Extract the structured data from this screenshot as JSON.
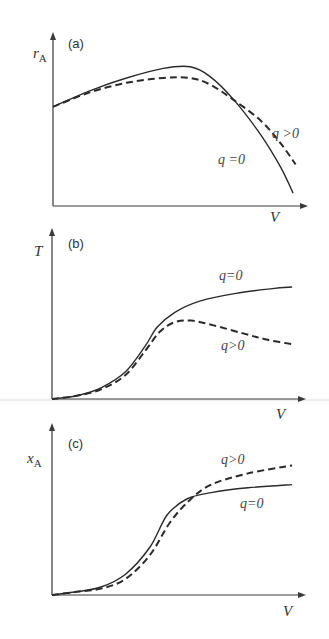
{
  "chart_data": [
    {
      "type": "line",
      "panel": "(a)",
      "ylabel": "r",
      "ylabel_sub": "A",
      "xlabel": "V",
      "grid": false,
      "legend": "inline curve labels",
      "series": [
        {
          "name": "q=0",
          "style": "solid",
          "points": [
            [
              0,
              0.62
            ],
            [
              0.15,
              0.72
            ],
            [
              0.3,
              0.8
            ],
            [
              0.45,
              0.86
            ],
            [
              0.56,
              0.87
            ],
            [
              0.64,
              0.81
            ],
            [
              0.74,
              0.66
            ],
            [
              0.85,
              0.44
            ],
            [
              0.93,
              0.24
            ],
            [
              0.98,
              0.08
            ]
          ]
        },
        {
          "name": "q>0",
          "style": "dashed",
          "points": [
            [
              0,
              0.62
            ],
            [
              0.15,
              0.71
            ],
            [
              0.3,
              0.77
            ],
            [
              0.45,
              0.8
            ],
            [
              0.56,
              0.8
            ],
            [
              0.64,
              0.76
            ],
            [
              0.74,
              0.66
            ],
            [
              0.85,
              0.53
            ],
            [
              0.93,
              0.39
            ],
            [
              0.99,
              0.26
            ]
          ]
        }
      ],
      "annotations": [
        {
          "text": "q=0",
          "x": 0.68,
          "y": 0.3
        },
        {
          "text": "q>0",
          "x": 0.88,
          "y": 0.46
        }
      ]
    },
    {
      "type": "line",
      "panel": "(b)",
      "ylabel": "T",
      "ylabel_sub": "",
      "xlabel": "V",
      "grid": false,
      "legend": "inline curve labels",
      "series": [
        {
          "name": "q=0",
          "style": "solid",
          "points": [
            [
              0,
              0
            ],
            [
              0.1,
              0.02
            ],
            [
              0.2,
              0.07
            ],
            [
              0.3,
              0.17
            ],
            [
              0.38,
              0.33
            ],
            [
              0.43,
              0.45
            ],
            [
              0.5,
              0.54
            ],
            [
              0.6,
              0.61
            ],
            [
              0.75,
              0.66
            ],
            [
              0.9,
              0.69
            ],
            [
              0.98,
              0.7
            ]
          ]
        },
        {
          "name": "q>0",
          "style": "dashed",
          "points": [
            [
              0,
              0
            ],
            [
              0.1,
              0.02
            ],
            [
              0.2,
              0.06
            ],
            [
              0.3,
              0.15
            ],
            [
              0.38,
              0.3
            ],
            [
              0.44,
              0.42
            ],
            [
              0.5,
              0.48
            ],
            [
              0.57,
              0.49
            ],
            [
              0.66,
              0.46
            ],
            [
              0.78,
              0.41
            ],
            [
              0.88,
              0.37
            ],
            [
              0.99,
              0.34
            ]
          ]
        }
      ],
      "annotations": [
        {
          "text": "q=0",
          "x": 0.7,
          "y": 0.78
        },
        {
          "text": "q>0",
          "x": 0.71,
          "y": 0.32
        }
      ]
    },
    {
      "type": "line",
      "panel": "(c)",
      "ylabel": "x",
      "ylabel_sub": "A",
      "xlabel": "V",
      "grid": false,
      "legend": "inline curve labels",
      "series": [
        {
          "name": "q=0",
          "style": "solid",
          "points": [
            [
              0,
              0
            ],
            [
              0.1,
              0.02
            ],
            [
              0.2,
              0.05
            ],
            [
              0.3,
              0.13
            ],
            [
              0.4,
              0.3
            ],
            [
              0.47,
              0.5
            ],
            [
              0.55,
              0.6
            ],
            [
              0.65,
              0.64
            ],
            [
              0.8,
              0.67
            ],
            [
              0.98,
              0.69
            ]
          ]
        },
        {
          "name": "q>0",
          "style": "dashed",
          "points": [
            [
              0,
              0
            ],
            [
              0.1,
              0.02
            ],
            [
              0.2,
              0.04
            ],
            [
              0.3,
              0.1
            ],
            [
              0.4,
              0.25
            ],
            [
              0.48,
              0.45
            ],
            [
              0.56,
              0.59
            ],
            [
              0.65,
              0.69
            ],
            [
              0.8,
              0.76
            ],
            [
              0.98,
              0.81
            ]
          ]
        }
      ],
      "annotations": [
        {
          "text": "q>0",
          "x": 0.71,
          "y": 0.83
        },
        {
          "text": "q=0",
          "x": 0.78,
          "y": 0.57
        }
      ]
    }
  ],
  "panels": [
    {
      "tag": "(a)",
      "ylabel": "r",
      "ylabel_sub": "A",
      "xlabel": "V",
      "label_q0": "q =0",
      "label_qpos": "q >0"
    },
    {
      "tag": "(b)",
      "ylabel": "T",
      "ylabel_sub": "",
      "xlabel": "V",
      "label_q0": "q=0",
      "label_qpos": "q>0"
    },
    {
      "tag": "(c)",
      "ylabel": "x",
      "ylabel_sub": "A",
      "xlabel": "V",
      "label_q0": "q=0",
      "label_qpos": "q>0"
    }
  ],
  "layout": [
    {
      "ox": 53,
      "oy": 206,
      "ytop": 33,
      "xend": 307,
      "w": 245,
      "h": 160
    },
    {
      "ox": 52,
      "oy": 399,
      "ytop": 230,
      "xend": 305,
      "w": 245,
      "h": 160
    },
    {
      "ox": 52,
      "oy": 595,
      "ytop": 425,
      "xend": 305,
      "w": 245,
      "h": 160
    }
  ]
}
